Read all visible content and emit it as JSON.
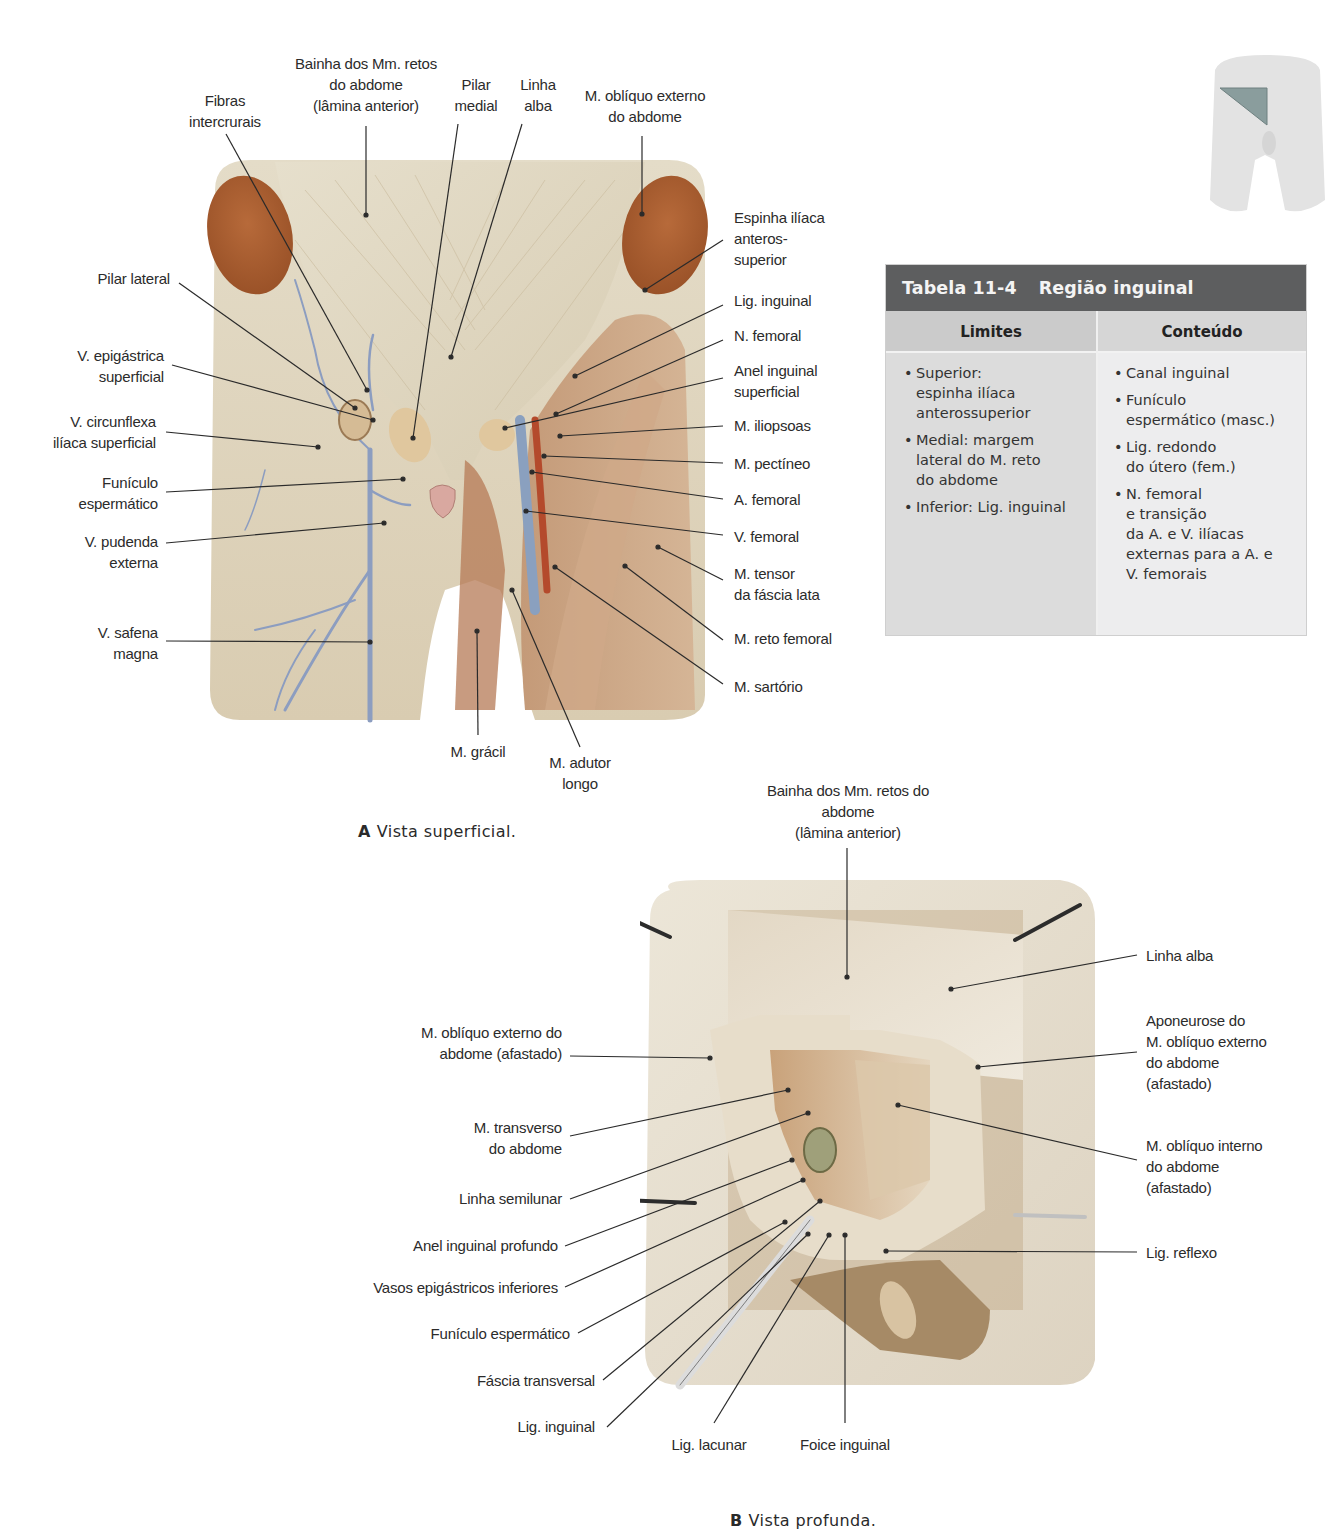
{
  "figure_a": {
    "caption_letter": "A",
    "caption_text": "Vista superficial.",
    "labels": {
      "bainha": "Bainha dos Mm. retos\ndo abdome\n(lâmina anterior)",
      "pilar_medial": "Pilar\nmedial",
      "linha_alba": "Linha\nalba",
      "obliquo_externo": "M. oblíquo externo\ndo abdome",
      "fibras_intercrurais": "Fibras\nintercrurais",
      "pilar_lateral": "Pilar lateral",
      "v_epigastrica": "V. epigástrica\nsuperficial",
      "v_circunflexa": "V. circunflexa\nilíaca superficial",
      "funiculo": "Funículo\nespermático",
      "v_pudenda": "V. pudenda\nexterna",
      "v_safena": "V. safena\nmagna",
      "espinha_iliaca": "Espinha ilíaca\nanteros-\nsuperior",
      "lig_inguinal": "Lig. inguinal",
      "n_femoral": "N. femoral",
      "anel_superficial": "Anel inguinal\nsuperficial",
      "iliopsoas": "M. iliopsoas",
      "pectineo": "M. pectíneo",
      "a_femoral": "A. femoral",
      "v_femoral": "V. femoral",
      "tensor": "M. tensor\nda fáscia lata",
      "reto_femoral": "M. reto femoral",
      "sartorio": "M. sartório",
      "gracil": "M. grácil",
      "adutor_longo": "M. adutor\nlongo"
    }
  },
  "figure_b": {
    "caption_letter": "B",
    "caption_text": "Vista profunda.",
    "labels": {
      "bainha": "Bainha dos Mm. retos do\nabdome\n(lâmina anterior)",
      "linha_alba": "Linha alba",
      "aponeurose": "Aponeurose do\nM. oblíquo externo\ndo abdome\n(afastado)",
      "obliquo_interno": "M. oblíquo interno\ndo abdome\n(afastado)",
      "lig_reflexo": "Lig. reflexo",
      "obliquo_externo": "M. oblíquo externo do\nabdome (afastado)",
      "transverso": "M. transverso\ndo abdome",
      "linha_semilunar": "Linha semilunar",
      "anel_profundo": "Anel inguinal profundo",
      "vasos_epigastricos": "Vasos epigástricos inferiores",
      "funiculo": "Funículo espermático",
      "fascia_transversal": "Fáscia transversal",
      "lig_inguinal": "Lig. inguinal",
      "lig_lacunar": "Lig. lacunar",
      "foice_inguinal": "Foice inguinal"
    }
  },
  "table": {
    "number": "Tabela 11-4",
    "title": "Região inguinal",
    "columns": [
      {
        "header": "Limites",
        "items": [
          "Superior:\nespinha ilíaca\nanterossuperior",
          "Medial: margem\nlateral do M. reto\ndo abdome",
          "Inferior: Lig. inguinal"
        ]
      },
      {
        "header": "Conteúdo",
        "items": [
          "Canal inguinal",
          "Funículo\nespermático (masc.)",
          "Lig. redondo\ndo útero (fem.)",
          "N. femoral\ne transição\nda A. e V. ilíacas\nexternas para a A. e\nV. femorais"
        ]
      }
    ],
    "colors": {
      "title_bar": "#5d5e5f",
      "header_bg": "#cbcbcb",
      "left_body": "#dcdcdc",
      "right_body": "#ededee"
    }
  },
  "thumbnail": {
    "highlight_color": "#7f9494"
  }
}
